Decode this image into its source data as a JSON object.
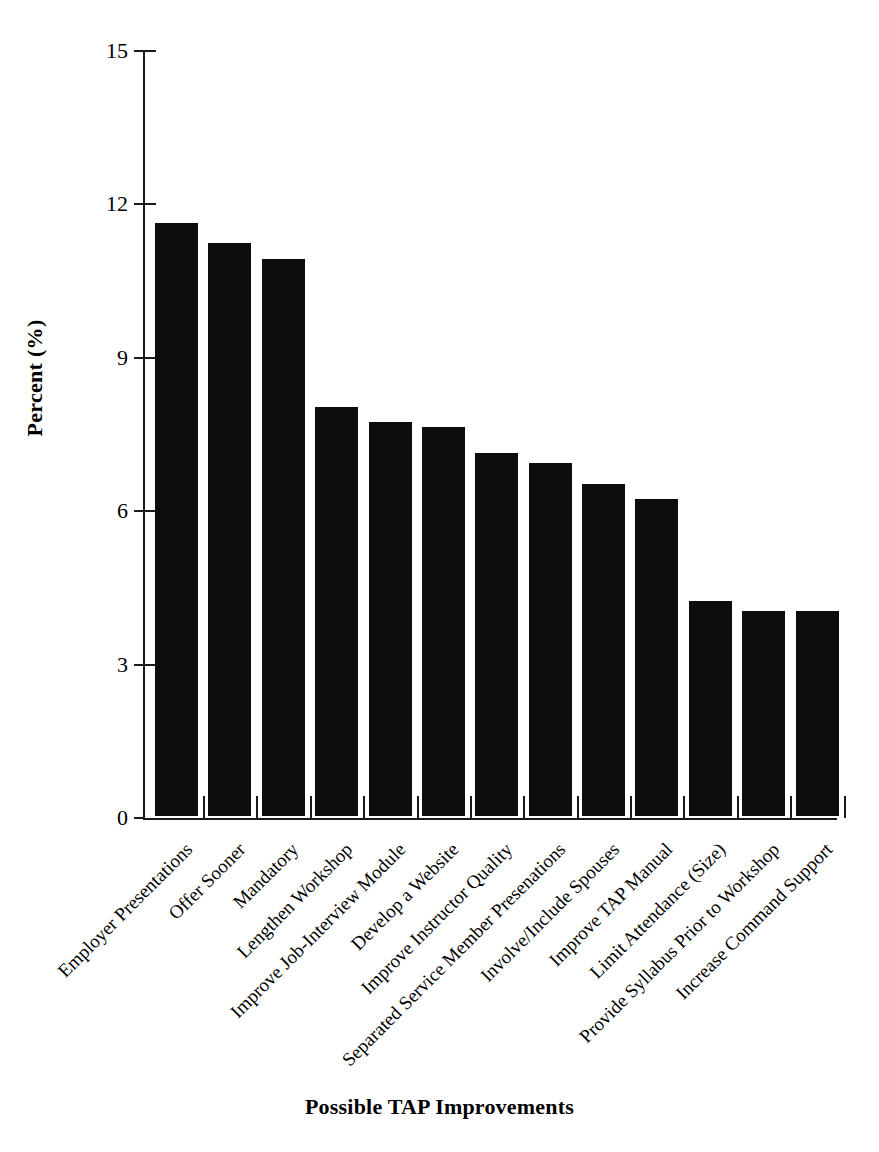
{
  "chart_data": {
    "type": "bar",
    "title": "",
    "xlabel": "Possible TAP Improvements",
    "ylabel": "Percent (%)",
    "ylim": [
      0,
      15
    ],
    "yticks": [
      0,
      3,
      6,
      9,
      12,
      15
    ],
    "ytick_labels": [
      "0",
      "3",
      "6",
      "9",
      "12",
      "15"
    ],
    "grid": false,
    "legend": null,
    "bar_color": "#0d0d0d",
    "categories": [
      "Employer Presentations",
      "Offer Sooner",
      "Mandatory",
      "Lengthen Workshop",
      "Improve Job-Interview Module",
      "Develop a Website",
      "Improve Instructor Quality",
      "Separated Service Member Presenations",
      "Involve/Include Spouses",
      "Improve TAP Manual",
      "Limit Attendance (Size)",
      "Provide Syllabus Prior to Workshop",
      "Increase Command Support"
    ],
    "values": [
      11.6,
      11.2,
      10.9,
      8.0,
      7.7,
      7.6,
      7.1,
      6.9,
      6.5,
      6.2,
      4.2,
      4.0,
      4.0
    ]
  }
}
